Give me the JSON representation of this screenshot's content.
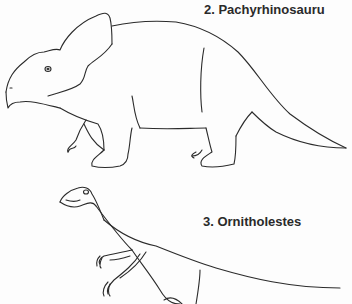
{
  "illustration": {
    "labels": [
      {
        "number": "2.",
        "name": "Pachyrhinosauru",
        "text": "2.  Pachyrhinosauru"
      },
      {
        "number": "3.",
        "name": "Ornitholestes",
        "text": "3.  Ornitholestes"
      }
    ],
    "figures": [
      {
        "id": "pachyrhinosaurus",
        "description": "line drawing of a frilled ceratopsian dinosaur walking left"
      },
      {
        "id": "ornitholestes",
        "description": "line drawing of a small bipedal theropod dinosaur facing left"
      }
    ],
    "colors": {
      "line": "#2b2b2b",
      "background": "#fdfdfd"
    }
  }
}
